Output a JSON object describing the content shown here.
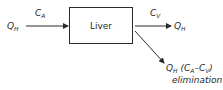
{
  "diagram": {
    "type": "flow",
    "node": {
      "label": "Liver"
    },
    "inflow": {
      "flow_symbol": "Q",
      "flow_sub": "H",
      "conc_symbol": "C",
      "conc_sub": "A"
    },
    "outflow": {
      "flow_symbol": "Q",
      "flow_sub": "H",
      "conc_symbol": "C",
      "conc_sub": "V"
    },
    "elimination": {
      "expr_q": "Q",
      "expr_q_sub": "H",
      "expr_open": " (C",
      "expr_a_sub": "A",
      "expr_minus": "–C",
      "expr_v_sub": "V",
      "expr_close": ")",
      "label": "elimination"
    },
    "colors": {
      "line": "#2a2a2a",
      "text": "#2a2a2a",
      "background": "#ffffff"
    }
  }
}
